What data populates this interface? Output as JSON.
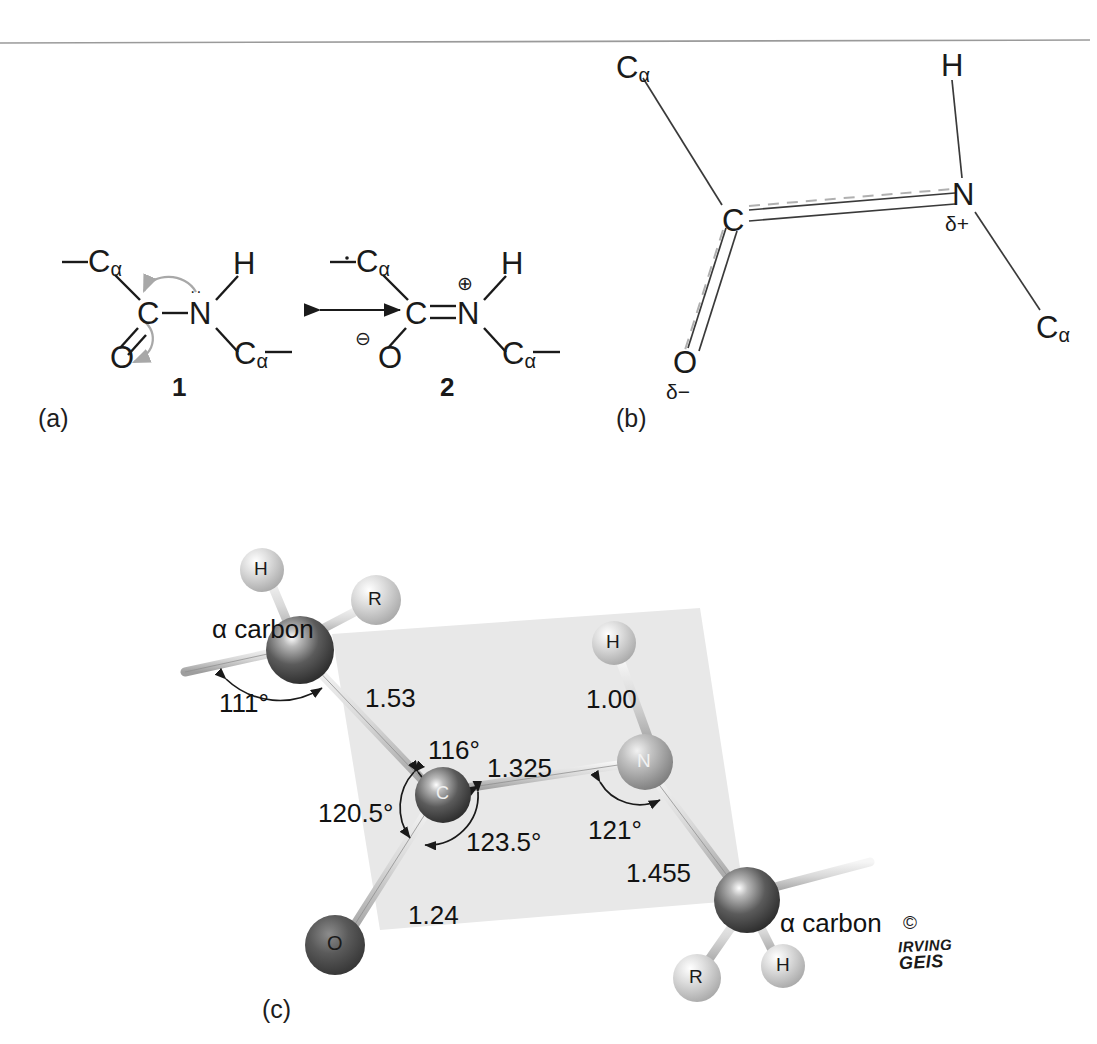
{
  "figure": {
    "panels": [
      {
        "id": "a",
        "label": "(a)"
      },
      {
        "id": "b",
        "label": "(b)"
      },
      {
        "id": "c",
        "label": "(c)"
      }
    ]
  },
  "panel_a": {
    "structure1": {
      "number": "1",
      "atoms": {
        "c_alpha_left": "C",
        "c_alpha_left_sub": "α",
        "carbonyl_c": "C",
        "oxygen": "O",
        "nitrogen": "N",
        "hydrogen": "H",
        "c_alpha_right": "C",
        "c_alpha_right_sub": "α"
      },
      "lone_pair": "··",
      "arrow_note": "curved electron-pushing arrows"
    },
    "resonance_arrow": "↔",
    "structure2": {
      "number": "2",
      "atoms": {
        "c_alpha_left": "C",
        "c_alpha_left_sub": "α",
        "carbonyl_c": "C",
        "oxygen": "O",
        "nitrogen": "N",
        "hydrogen": "H",
        "c_alpha_right": "C",
        "c_alpha_right_sub": "α"
      },
      "charges": {
        "oxygen": "⊖",
        "nitrogen": "⊕"
      }
    }
  },
  "panel_b": {
    "atoms": {
      "c_alpha_top": "C",
      "c_alpha_top_sub": "α",
      "hydrogen": "H",
      "carbonyl_c": "C",
      "nitrogen": "N",
      "oxygen": "O",
      "c_alpha_right": "C",
      "c_alpha_right_sub": "α"
    },
    "partial_charges": {
      "nitrogen": "δ+",
      "oxygen": "δ−"
    }
  },
  "panel_c": {
    "atom_labels": {
      "alpha_carbon_left": "α carbon",
      "alpha_carbon_right": "α carbon",
      "h_top": "H",
      "r_top": "R",
      "h_nitrogen": "H",
      "nitrogen": "N",
      "carbonyl": "C",
      "oxygen": "O",
      "r_bottom": "R",
      "h_bottom": "H"
    },
    "bond_lengths": [
      {
        "name": "c_alpha_to_carbonyl",
        "value": "1.53"
      },
      {
        "name": "carbonyl_to_nitrogen",
        "value": "1.325"
      },
      {
        "name": "carbonyl_to_oxygen",
        "value": "1.24"
      },
      {
        "name": "nitrogen_to_hydrogen",
        "value": "1.00"
      },
      {
        "name": "nitrogen_to_c_alpha",
        "value": "1.455"
      }
    ],
    "bond_angles": [
      {
        "name": "alpha_carbon_angle",
        "value": "111°"
      },
      {
        "name": "c_alpha_c_n_angle",
        "value": "116°"
      },
      {
        "name": "c_alpha_c_o_angle",
        "value": "120.5°"
      },
      {
        "name": "o_c_n_angle",
        "value": "123.5°"
      },
      {
        "name": "c_n_c_alpha_angle",
        "value": "121°"
      }
    ]
  },
  "credit": {
    "copyright_symbol": "©",
    "line1": "IRVING",
    "line2": "GEIS"
  },
  "colors": {
    "ink": "#1a1a1a",
    "plane": "#e6e6e6",
    "bond": "#cfcfcf",
    "arrow_gray": "#a8a8a8",
    "dark_atom": "#3c3c3c",
    "light_atom": "#c9c9c9",
    "oxygen_atom": "#4a4a4a"
  }
}
